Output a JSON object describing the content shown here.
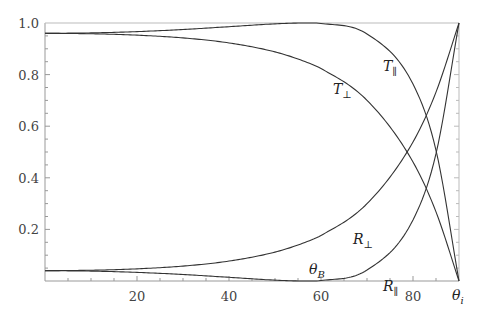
{
  "chart_data": {
    "type": "line",
    "title": "",
    "xlabel": "θ_i",
    "ylabel": "",
    "xlim": [
      0,
      90
    ],
    "ylim": [
      0,
      1.0
    ],
    "grid": false,
    "legend": "inline labels",
    "x_ticks": [
      20,
      40,
      60,
      80
    ],
    "x_tick_labels": [
      "20",
      "40",
      "60",
      "80"
    ],
    "y_ticks": [
      0.2,
      0.4,
      0.6,
      0.8,
      1.0
    ],
    "y_tick_labels": [
      "0.2",
      "0.4",
      "0.6",
      "0.8",
      "1.0"
    ],
    "x": [
      0,
      10,
      20,
      30,
      40,
      50,
      56.3,
      60,
      70,
      80,
      85,
      90
    ],
    "series": [
      {
        "name": "R⊥",
        "label_main": "R",
        "label_sub": "⊥",
        "values": [
          0.04,
          0.0417,
          0.0471,
          0.0578,
          0.0772,
          0.112,
          0.148,
          0.1766,
          0.2996,
          0.5387,
          0.7322,
          1.0
        ]
      },
      {
        "name": "R∥",
        "label_main": "R",
        "label_sub": "∥",
        "values": [
          0.04,
          0.0384,
          0.0334,
          0.0252,
          0.0143,
          0.0033,
          0.0,
          0.0018,
          0.0425,
          0.2368,
          0.4933,
          1.0
        ]
      },
      {
        "name": "T⊥",
        "label_main": "T",
        "label_sub": "⊥",
        "values": [
          0.96,
          0.9583,
          0.9529,
          0.9422,
          0.9228,
          0.888,
          0.852,
          0.8234,
          0.7004,
          0.4613,
          0.2678,
          0.0
        ]
      },
      {
        "name": "T∥",
        "label_main": "T",
        "label_sub": "∥",
        "values": [
          0.96,
          0.9616,
          0.9666,
          0.9748,
          0.9857,
          0.9967,
          1.0,
          0.9982,
          0.9575,
          0.7632,
          0.5067,
          0.0
        ]
      }
    ],
    "annotations": [
      {
        "text": "θ_B",
        "main": "θ",
        "sub": "B",
        "x": 56.3
      }
    ],
    "x_end_label": {
      "main": "θ",
      "sub": "i"
    }
  }
}
